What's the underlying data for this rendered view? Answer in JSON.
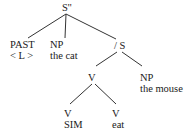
{
  "diagram": {
    "type": "syntax-tree",
    "nodes": {
      "root": {
        "label": "S''"
      },
      "past": {
        "label": "PAST",
        "sub": "< L >"
      },
      "np_subj": {
        "label": "NP",
        "sub": "the cat"
      },
      "slash_s": {
        "label": "/ S"
      },
      "v_complex": {
        "label": "V"
      },
      "np_obj": {
        "label": "NP",
        "sub": "the mouse"
      },
      "v_sim": {
        "label": "V",
        "sub": "SIM"
      },
      "v_eat": {
        "label": "V",
        "sub": "eat"
      }
    },
    "edges": [
      [
        "root",
        "past"
      ],
      [
        "root",
        "np_subj"
      ],
      [
        "root",
        "slash_s"
      ],
      [
        "slash_s",
        "v_complex"
      ],
      [
        "slash_s",
        "np_obj"
      ],
      [
        "v_complex",
        "v_sim"
      ],
      [
        "v_complex",
        "v_eat"
      ]
    ],
    "line_color": "#333333"
  }
}
